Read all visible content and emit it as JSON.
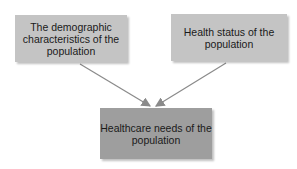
{
  "diagram": {
    "nodes": [
      {
        "id": "demographics",
        "label": "The demographic characteristics of the population"
      },
      {
        "id": "health_status",
        "label": "Health status of the population"
      },
      {
        "id": "healthcare_needs",
        "label": "Healthcare needs of the population"
      }
    ],
    "edges": [
      {
        "from": "demographics",
        "to": "healthcare_needs"
      },
      {
        "from": "health_status",
        "to": "healthcare_needs"
      }
    ],
    "colors": {
      "source_box": "#c4c4c4",
      "target_box": "#9e9e9e",
      "arrow": "#8a8a8a"
    }
  }
}
